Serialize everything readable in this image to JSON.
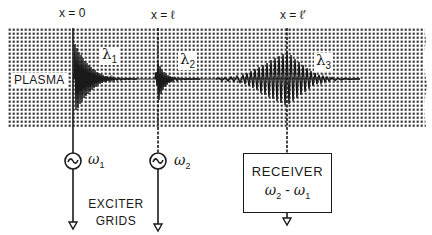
{
  "diagram": {
    "type": "schematic",
    "region_label": "PLASMA",
    "positions": [
      {
        "id": "x0",
        "label": "x = 0",
        "x_px": 73
      },
      {
        "id": "xl",
        "label": "x = ℓ",
        "x_px": 158
      },
      {
        "id": "xlp",
        "label": "x = ℓ′",
        "x_px": 287
      }
    ],
    "wavelengths": [
      {
        "symbol": "λ",
        "subscript": "1"
      },
      {
        "symbol": "λ",
        "subscript": "2"
      },
      {
        "symbol": "λ",
        "subscript": "3"
      }
    ],
    "exciters": [
      {
        "symbol": "ω",
        "subscript": "1",
        "source_glyph": "~"
      },
      {
        "symbol": "ω",
        "subscript": "2",
        "source_glyph": "~"
      }
    ],
    "exciter_label_line1": "EXCITER",
    "exciter_label_line2": "GRIDS",
    "receiver": {
      "title": "RECEIVER",
      "freq_a_symbol": "ω",
      "freq_a_sub": "2",
      "minus": " - ",
      "freq_b_symbol": "ω",
      "freq_b_sub": "1"
    },
    "colors": {
      "ink": "#1a1a1a",
      "plasma_dots": "#3a3a3a",
      "background": "#ffffff"
    }
  }
}
